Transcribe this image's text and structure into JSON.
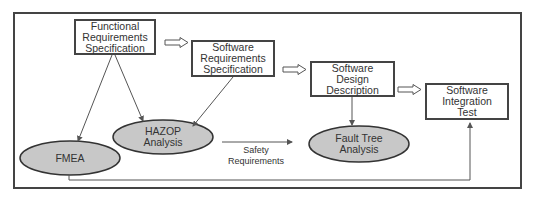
{
  "diagram": {
    "boxes": [
      {
        "id": "functional-requirements-specification",
        "label": "Functional\nRequirements\nSpecification"
      },
      {
        "id": "software-requirements-specification",
        "label": "Software\nRequirements\nSpecification"
      },
      {
        "id": "software-design-description",
        "label": "Software\nDesign\nDescription"
      },
      {
        "id": "software-integration-test",
        "label": "Software\nIntegration\nTest"
      }
    ],
    "analyses": [
      {
        "id": "fmea",
        "label": "FMEA"
      },
      {
        "id": "hazop-analysis",
        "label": "HAZOP\nAnalysis"
      },
      {
        "id": "fault-tree-analysis",
        "label": "Fault Tree\nAnalysis"
      }
    ],
    "edge_labels": {
      "safety_requirements": "Safety\nRequirements"
    },
    "colors": {
      "frame": "#444444",
      "ellipse_fill": "#c8c8c8",
      "line": "#555555"
    }
  }
}
